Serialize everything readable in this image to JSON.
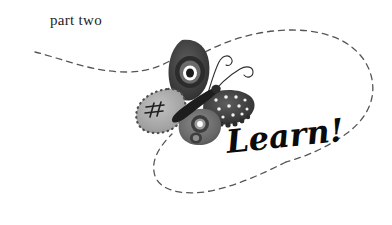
{
  "page": {
    "background_color": "#ffffff",
    "width": 392,
    "height": 225
  },
  "part_label": {
    "text": "part two",
    "color": "#1d1d1d"
  },
  "word_mark": {
    "text": "Learn!",
    "color": "#0b0b0b"
  },
  "illustration": {
    "name": "butterfly",
    "description": "Stylized hand-painted butterfly with four patterned wings and curling antennae",
    "palette": {
      "dark": "#3b3b3b",
      "mid": "#6e6e6e",
      "light": "#a9a9a9",
      "pale": "#c9c9c9",
      "white": "#ffffff"
    },
    "wings": [
      {
        "name": "upper-left-wing",
        "pattern": "concentric-eye-rings",
        "tone": "dark"
      },
      {
        "name": "lower-left-wing",
        "pattern": "dotted-border-with-hash",
        "tone": "light"
      },
      {
        "name": "upper-right-wing",
        "pattern": "white-dots-scalloped-edge",
        "tone": "dark"
      },
      {
        "name": "lower-right-wing",
        "pattern": "concentric-eye-rings",
        "tone": "mid"
      }
    ],
    "antennae": {
      "name": "curling-antennae",
      "count": 2,
      "style": "spiral"
    }
  },
  "dashed_ribbon": {
    "name": "dashed-loop-path",
    "color": "#555555",
    "dash_pattern": "6 5",
    "stroke_width": 1.3,
    "description": "Continuous dashed ribbon entering at left, dipping, rising past the butterfly, sweeping right into a large loop, then returning left beneath the word mark"
  }
}
